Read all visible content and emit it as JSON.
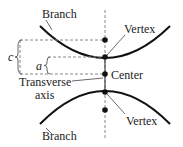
{
  "diagram": {
    "type": "hyperbola",
    "labels": {
      "branch_top": "Branch",
      "branch_bottom": "Branch",
      "vertex_top": "Vertex",
      "vertex_bottom": "Vertex",
      "center": "Center",
      "transverse_line1": "Transverse",
      "transverse_line2": "axis",
      "c": "c",
      "a": "a"
    },
    "colors": {
      "curve": "#111111",
      "dashed": "#888888",
      "text": "#222222"
    }
  }
}
